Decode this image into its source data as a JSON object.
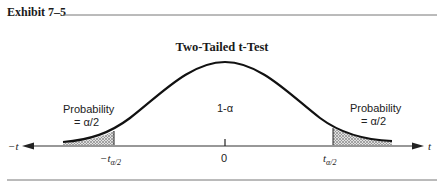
{
  "header": {
    "exhibit_label": "Exhibit 7–5"
  },
  "diagram": {
    "title": "Two-Tailed t-Test",
    "center_label": "1-α",
    "left_tail": {
      "label_line1": "Probability",
      "label_line2": "= α/2",
      "critical_value": "−t",
      "critical_subscript": "α/2"
    },
    "right_tail": {
      "label_line1": "Probability",
      "label_line2": "= α/2",
      "critical_value": "t",
      "critical_subscript": "α/2"
    },
    "axis": {
      "left_label": "−t",
      "right_label": "t",
      "center_tick": "0"
    },
    "colors": {
      "curve": "#111111",
      "shade": "#9a9a9a",
      "rule": "#555555"
    }
  }
}
